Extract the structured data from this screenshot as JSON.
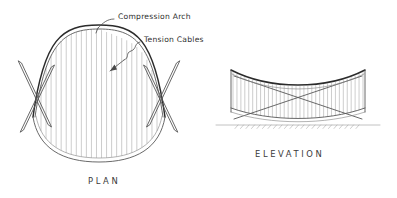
{
  "figure": {
    "background_color": "#ffffff",
    "ink_color": "#3a3a3a",
    "style": "hand-drawn architectural sketch"
  },
  "annotations": [
    {
      "id": "compression-arch",
      "label": "Compression Arch",
      "x": 118,
      "y": 16,
      "leader": "M 114 19 C 107 19 103 23 98 28",
      "tick": "M 98 28 L 96 33"
    },
    {
      "id": "tension-cables",
      "label": "Tension Cables",
      "x": 144,
      "y": 39,
      "leader": "M 140 42 C 134 43 137 49 131 51 C 125 53 130 58 124 60",
      "arrow_line": "M 124 60 L 110 71",
      "arrow_head": "M 110 71 L 116 69 L 114 65 Z"
    }
  ],
  "captions": [
    {
      "id": "plan-caption",
      "label": "PLAN",
      "x": 88,
      "y": 184
    },
    {
      "id": "elevation-caption",
      "label": "ELEVATION",
      "x": 297,
      "y": 157
    }
  ],
  "plan_view": {
    "name": "PLAN",
    "center_x": 99,
    "top_y": 28,
    "bottom_y": 160,
    "left_tip_x": 33,
    "right_tip_x": 165,
    "cable_count": 24,
    "cable_color": "#8a8a8a",
    "arch_outer_top": "M 33 117 C 44 38 62 25 99 25 C 136 25 154 38 165 117",
    "arch_inner_top": "M 35 117 C 46 43 63 29 99 29 C 135 29 152 43 163 117",
    "arch_outer_bottom": "M 33 117 C 38 148 62 162 99 162 C 136 162 160 148 165 117",
    "arch_inner_bottom": "M 36 116 C 41 144 63 158 99 158 C 135 158 157 144 162 116",
    "left_strut_a": "M 20 62 L 50 126",
    "left_strut_b": "M 22 131 L 53 66",
    "right_strut_a": "M 178 62 L 148 126",
    "right_strut_b": "M 176 131 L 145 66",
    "strut_width": 3.4
  },
  "elevation_view": {
    "name": "ELEVATION",
    "left_x": 230,
    "right_x": 366,
    "top_left_y": 70,
    "top_right_y": 70,
    "sag_center_y": 92,
    "deck_left_y": 110,
    "deck_center_y": 118,
    "ground_y": 125,
    "hanger_count": 34,
    "roof_curve_upper": "M 231 70 C 270 90 326 90 365 70",
    "roof_curve_lower": "M 232 74 C 271 94 325 94 364 74",
    "deck_curve_upper": "M 231 108 C 270 122 326 122 365 108",
    "deck_curve_lower": "M 231 112 C 270 125 326 125 365 112",
    "strut_a": "M 234 76 L 362 119",
    "strut_b": "M 362 76 L 234 119",
    "ground_line": "M 216 125 L 380 125",
    "left_post": "M 231 70 L 231 112",
    "right_post": "M 365 70 L 365 112"
  }
}
